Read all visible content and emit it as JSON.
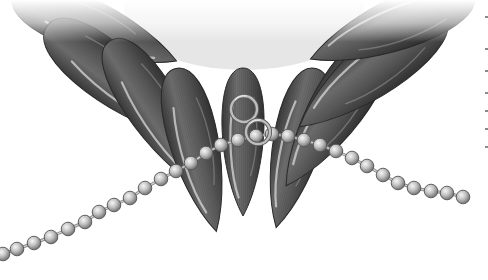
{
  "image": {
    "subject": "Fan of glossy dark-gray teardrop petal beads with linked jump rings and a ball chain",
    "width": 488,
    "height": 280,
    "background": "#ffffff"
  },
  "colors": {
    "petal_dark": "#3f3f3f",
    "petal_mid": "#6e6e6e",
    "petal_light": "#9c9c9c",
    "petal_highlight": "#d8d8d8",
    "petal_outline": "#2a2a2a",
    "bead_light": "#f2f2f2",
    "bead_mid": "#b5b5b5",
    "bead_dark": "#6a6a6a",
    "bead_outline": "#555555",
    "ring": "#bdbdbd",
    "ring_outline": "#5a5a5a",
    "top_fade": "#ffffff"
  },
  "petals": [
    {
      "name": "petal-far-left",
      "cx": 95,
      "cy": 28,
      "rx": 28,
      "ry": 88,
      "rot": -68
    },
    {
      "name": "petal-left-2",
      "cx": 120,
      "cy": 82,
      "rx": 30,
      "ry": 92,
      "rot": -52
    },
    {
      "name": "petal-left-3",
      "cx": 160,
      "cy": 118,
      "rx": 28,
      "ry": 92,
      "rot": -33
    },
    {
      "name": "petal-left-4",
      "cx": 196,
      "cy": 150,
      "rx": 26,
      "ry": 84,
      "rot": -14
    },
    {
      "name": "petal-center",
      "cx": 243,
      "cy": 142,
      "rx": 22,
      "ry": 74,
      "rot": 0
    },
    {
      "name": "petal-right-4",
      "cx": 296,
      "cy": 148,
      "rx": 26,
      "ry": 82,
      "rot": 14
    },
    {
      "name": "petal-right-3",
      "cx": 334,
      "cy": 112,
      "rx": 29,
      "ry": 88,
      "rot": 33
    },
    {
      "name": "petal-right-2",
      "cx": 372,
      "cy": 70,
      "rx": 30,
      "ry": 92,
      "rot": 52
    },
    {
      "name": "petal-far-right",
      "cx": 392,
      "cy": 26,
      "rx": 28,
      "ry": 88,
      "rot": 68
    }
  ],
  "rings": [
    {
      "name": "jump-ring-upper",
      "cx": 244,
      "cy": 109,
      "r": 13
    },
    {
      "name": "jump-ring-lower",
      "cx": 258,
      "cy": 132,
      "r": 12
    }
  ],
  "chain": {
    "bead_radius": 6.8,
    "beads": [
      [
        3,
        254
      ],
      [
        17,
        249
      ],
      [
        34,
        243
      ],
      [
        51,
        237
      ],
      [
        68,
        229
      ],
      [
        85,
        222
      ],
      [
        99,
        212
      ],
      [
        114,
        205
      ],
      [
        130,
        198
      ],
      [
        145,
        188
      ],
      [
        161,
        179
      ],
      [
        176,
        171
      ],
      [
        191,
        163
      ],
      [
        206,
        153
      ],
      [
        221,
        145
      ],
      [
        238,
        140
      ],
      [
        256,
        136
      ],
      [
        272,
        134
      ],
      [
        288,
        136
      ],
      [
        304,
        140
      ],
      [
        320,
        145
      ],
      [
        336,
        151
      ],
      [
        352,
        158
      ],
      [
        367,
        166
      ],
      [
        383,
        175
      ],
      [
        398,
        183
      ],
      [
        414,
        188
      ],
      [
        431,
        191
      ],
      [
        447,
        193
      ],
      [
        463,
        197
      ]
    ]
  },
  "edge_marks": [
    16,
    48,
    70,
    92,
    110,
    128,
    146
  ]
}
